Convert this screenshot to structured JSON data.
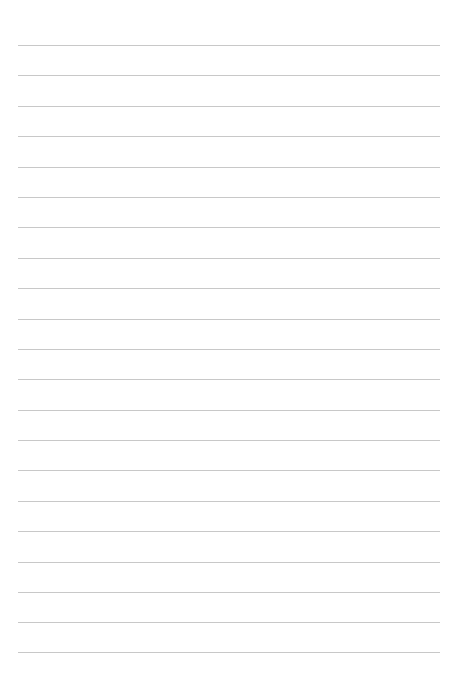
{
  "page": {
    "type": "lined-paper",
    "background_color": "#ffffff",
    "line_color": "#c8c8c8",
    "line_count": 22,
    "line_left": 18,
    "line_width": 422,
    "first_line_y": 45,
    "line_spacing": 30.4,
    "lines": [
      {
        "y": 45,
        "text": ""
      },
      {
        "y": 75,
        "text": ""
      },
      {
        "y": 106,
        "text": ""
      },
      {
        "y": 136,
        "text": ""
      },
      {
        "y": 167,
        "text": ""
      },
      {
        "y": 197,
        "text": ""
      },
      {
        "y": 227,
        "text": ""
      },
      {
        "y": 258,
        "text": ""
      },
      {
        "y": 288,
        "text": ""
      },
      {
        "y": 319,
        "text": ""
      },
      {
        "y": 349,
        "text": ""
      },
      {
        "y": 379,
        "text": ""
      },
      {
        "y": 410,
        "text": ""
      },
      {
        "y": 440,
        "text": ""
      },
      {
        "y": 470,
        "text": ""
      },
      {
        "y": 501,
        "text": ""
      },
      {
        "y": 531,
        "text": ""
      },
      {
        "y": 562,
        "text": ""
      },
      {
        "y": 592,
        "text": ""
      },
      {
        "y": 622,
        "text": ""
      },
      {
        "y": 652,
        "text": ""
      }
    ]
  }
}
